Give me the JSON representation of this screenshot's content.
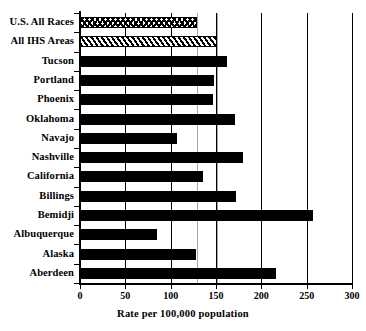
{
  "chart_data": {
    "type": "bar",
    "orientation": "horizontal",
    "title": "",
    "xlabel": "Rate per 100,000 population",
    "ylabel": "",
    "xlim": [
      0,
      300
    ],
    "xticks": [
      0,
      50,
      100,
      150,
      200,
      250,
      300
    ],
    "xtick_labels": [
      "0",
      "50",
      "100",
      "150",
      "200",
      "250",
      "300"
    ],
    "grid": "vertical",
    "legend": "none",
    "categories": [
      "U.S. All Races",
      "All IHS Areas",
      "Tucson",
      "Portland",
      "Phoenix",
      "Oklahoma",
      "Navajo",
      "Nashville",
      "California",
      "Billings",
      "Bemidji",
      "Albuquerque",
      "Alaska",
      "Aberdeen"
    ],
    "values": [
      129,
      151,
      162,
      148,
      147,
      171,
      107,
      180,
      136,
      172,
      257,
      85,
      128,
      216
    ],
    "bar_styles": [
      "hatch-cross",
      "hatch-diag",
      "solid",
      "solid",
      "solid",
      "solid",
      "solid",
      "solid",
      "solid",
      "solid",
      "solid",
      "solid",
      "solid",
      "solid"
    ],
    "reference_lines": [
      129,
      151
    ],
    "reference_line_color": "#a8a8a8",
    "bar_color": "#000000",
    "axis_color": "#000000",
    "background": "#ffffff"
  }
}
